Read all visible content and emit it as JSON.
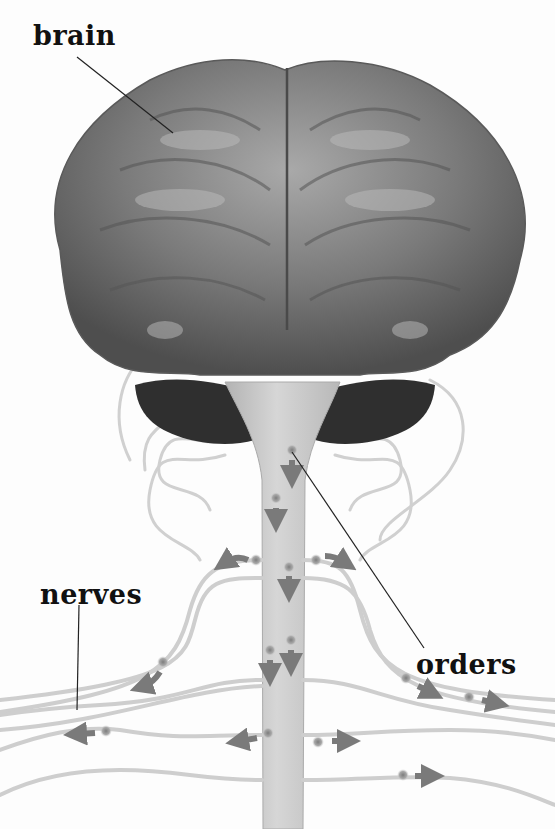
{
  "diagram": {
    "type": "anatomical illustration",
    "labels": {
      "brain": "brain",
      "nerves": "nerves",
      "orders": "orders"
    },
    "colors": {
      "background": "#fdfdfd",
      "brain_gray": "#6f6f6f",
      "cerebellum_dark": "#2e2e2e",
      "spinal_cord": "#c9c9c9",
      "nerve_fiber": "#cfcfcf",
      "arrow_gray": "#7a7a7a",
      "node_dot": "#9a9a9a",
      "leader_line": "#222222",
      "label_text": "#111111"
    },
    "arrows": {
      "down_on_cord": 5,
      "leftward": 5,
      "rightward": 5
    }
  }
}
